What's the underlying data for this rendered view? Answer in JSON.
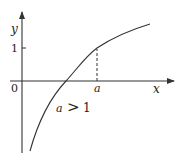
{
  "diagram": {
    "axes": {
      "x_label": "x",
      "y_label": "y",
      "origin_label": "0"
    },
    "ticks": {
      "y_tick_label": "1",
      "x_tick_label": "a"
    },
    "annotation": "a > 1",
    "annotation_var": "a",
    "annotation_rel": ">",
    "annotation_val": "1",
    "curve": {
      "type": "log",
      "passes_through": [
        [
          1,
          0
        ],
        [
          "a",
          1
        ]
      ],
      "color": "#333333"
    },
    "dashed_guide": "from (a,0) to (a,1)"
  }
}
